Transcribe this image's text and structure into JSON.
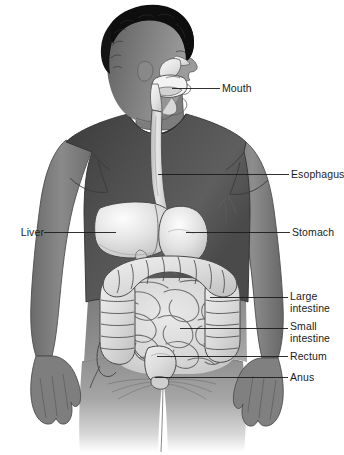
{
  "figure": {
    "background_color": "#ffffff",
    "line_color": "#1b1b1b",
    "text_color": "#1b1b1b"
  },
  "palette": {
    "hair": "#141414",
    "skin_dark": "#6e6e6e",
    "skin_mid": "#8c8c8c",
    "skin_light": "#a8a8a8",
    "shirt_dark": "#4a4a4a",
    "shirt_mid": "#5c5c5c",
    "shorts": "#9a9a9a",
    "organ_light": "#e8e8e8",
    "organ_mid": "#d2d2d2",
    "organ_shadow": "#b4b4b4",
    "outline": "#3a3a3a"
  },
  "labels": [
    {
      "id": "mouth",
      "text": "Mouth",
      "side": "right",
      "text_x": 222,
      "text_y": 83,
      "leader": {
        "x1": 205,
        "y1": 88,
        "x2": 220,
        "y2": 88
      },
      "anchor": {
        "x": 172,
        "y": 88
      },
      "lines": 1
    },
    {
      "id": "esophagus",
      "text": "Esophagus",
      "side": "right",
      "text_x": 291,
      "text_y": 169,
      "leader": {
        "x1": 163,
        "y1": 174,
        "x2": 289,
        "y2": 174
      },
      "anchor": {
        "x": 163,
        "y": 174
      },
      "lines": 1
    },
    {
      "id": "liver",
      "text": "Liver",
      "side": "left",
      "text_x": 20,
      "text_y": 227,
      "leader": {
        "x1": 44,
        "y1": 232,
        "x2": 116,
        "y2": 232
      },
      "anchor": {
        "x": 116,
        "y": 232
      },
      "lines": 1
    },
    {
      "id": "stomach",
      "text": "Stomach",
      "side": "right",
      "text_x": 292,
      "text_y": 227,
      "leader": {
        "x1": 186,
        "y1": 232,
        "x2": 290,
        "y2": 232
      },
      "anchor": {
        "x": 186,
        "y": 232
      },
      "lines": 1
    },
    {
      "id": "large-intestine",
      "text": "Large\nintestine",
      "side": "right",
      "text_x": 290,
      "text_y": 291,
      "leader": {
        "x1": 210,
        "y1": 297,
        "x2": 288,
        "y2": 297
      },
      "anchor": {
        "x": 210,
        "y": 297
      },
      "lines": 2
    },
    {
      "id": "small-intestine",
      "text": "Small\nintestine",
      "side": "right",
      "text_x": 290,
      "text_y": 321,
      "leader": {
        "x1": 180,
        "y1": 328,
        "x2": 288,
        "y2": 328
      },
      "anchor": {
        "x": 180,
        "y": 328
      },
      "lines": 2
    },
    {
      "id": "rectum",
      "text": "Rectum",
      "side": "right",
      "text_x": 290,
      "text_y": 351,
      "leader": {
        "x1": 157,
        "y1": 356,
        "x2": 288,
        "y2": 356
      },
      "anchor": {
        "x": 157,
        "y": 356
      },
      "lines": 1
    },
    {
      "id": "anus",
      "text": "Anus",
      "side": "right",
      "text_x": 290,
      "text_y": 372,
      "leader": {
        "x1": 155,
        "y1": 377,
        "x2": 288,
        "y2": 377
      },
      "anchor": {
        "x": 155,
        "y": 377
      },
      "lines": 1
    }
  ],
  "organs": [
    {
      "id": "oral-cavity",
      "name": "Mouth / oral cavity"
    },
    {
      "id": "esophagus-tube",
      "name": "Esophagus"
    },
    {
      "id": "liver-organ",
      "name": "Liver"
    },
    {
      "id": "stomach-organ",
      "name": "Stomach"
    },
    {
      "id": "large-intestine-organ",
      "name": "Large intestine (colon)"
    },
    {
      "id": "small-intestine-organ",
      "name": "Small intestine"
    },
    {
      "id": "rectum-organ",
      "name": "Rectum"
    },
    {
      "id": "anus-organ",
      "name": "Anus"
    }
  ],
  "body_parts": [
    {
      "id": "hair",
      "name": "Hair"
    },
    {
      "id": "head",
      "name": "Head"
    },
    {
      "id": "neck",
      "name": "Neck"
    },
    {
      "id": "torso-shirt",
      "name": "T-shirt"
    },
    {
      "id": "left-arm",
      "name": "Left arm"
    },
    {
      "id": "right-arm",
      "name": "Right arm"
    },
    {
      "id": "shorts",
      "name": "Shorts"
    }
  ]
}
